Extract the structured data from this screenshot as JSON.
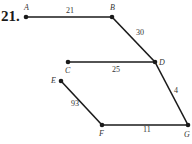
{
  "problem_number": "21.",
  "vertices": [
    {
      "id": "A",
      "x": 26,
      "y": 17,
      "lx": 24,
      "ly": 10
    },
    {
      "id": "B",
      "x": 112,
      "y": 17,
      "lx": 110,
      "ly": 10
    },
    {
      "id": "C",
      "x": 68,
      "y": 62,
      "lx": 65,
      "ly": 73
    },
    {
      "id": "D",
      "x": 155,
      "y": 62,
      "lx": 159,
      "ly": 65
    },
    {
      "id": "E",
      "x": 61,
      "y": 81,
      "lx": 51,
      "ly": 83
    },
    {
      "id": "F",
      "x": 102,
      "y": 125,
      "lx": 99,
      "ly": 136
    },
    {
      "id": "G",
      "x": 188,
      "y": 125,
      "lx": 184,
      "ly": 137
    }
  ],
  "edges": [
    {
      "from": "A",
      "to": "B",
      "weight": "21",
      "lx": 66,
      "ly": 13
    },
    {
      "from": "B",
      "to": "D",
      "weight": "30",
      "lx": 136,
      "ly": 35
    },
    {
      "from": "C",
      "to": "D",
      "weight": "25",
      "lx": 112,
      "ly": 72
    },
    {
      "from": "E",
      "to": "F",
      "weight": "93",
      "lx": 71,
      "ly": 106
    },
    {
      "from": "D",
      "to": "G",
      "weight": "4",
      "lx": 174,
      "ly": 93
    },
    {
      "from": "F",
      "to": "G",
      "weight": "11",
      "lx": 143,
      "ly": 132
    }
  ]
}
